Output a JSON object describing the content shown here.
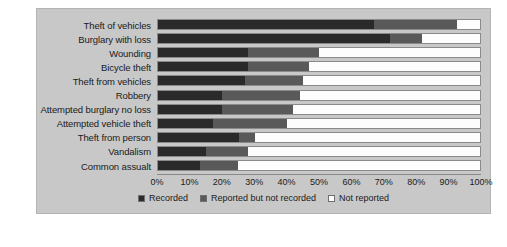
{
  "chart_data": {
    "type": "bar",
    "orientation": "horizontal",
    "stacked": "percent",
    "title": "",
    "xlabel": "",
    "ylabel": "",
    "xlim": [
      0,
      100
    ],
    "grid": false,
    "legend_position": "bottom",
    "tick_labels": [
      "0%",
      "10%",
      "20%",
      "30%",
      "40%",
      "50%",
      "60%",
      "70%",
      "80%",
      "90%",
      "100%"
    ],
    "tick_values": [
      0,
      10,
      20,
      30,
      40,
      50,
      60,
      70,
      80,
      90,
      100
    ],
    "categories": [
      "Theft of vehicles",
      "Burglary with loss",
      "Wounding",
      "Bicycle theft",
      "Theft from vehicles",
      "Robbery",
      "Attempted burglary no loss",
      "Attempted vehicle theft",
      "Theft from person",
      "Vandalism",
      "Common assualt"
    ],
    "series": [
      {
        "name": "Recorded",
        "color": "#2a2a2a",
        "values": [
          67,
          72,
          28,
          28,
          27,
          20,
          20,
          17,
          25,
          15,
          13
        ]
      },
      {
        "name": "Reported but not recorded",
        "color": "#595959",
        "values": [
          26,
          10,
          22,
          19,
          18,
          24,
          22,
          23,
          5,
          13,
          12
        ]
      },
      {
        "name": "Not reported",
        "color": "#fdfdfd",
        "values": [
          7,
          18,
          50,
          53,
          55,
          56,
          58,
          60,
          70,
          72,
          75
        ]
      }
    ]
  },
  "panel": {
    "background_color": "#c8c8c8",
    "border_color": "#b4b4b4"
  }
}
